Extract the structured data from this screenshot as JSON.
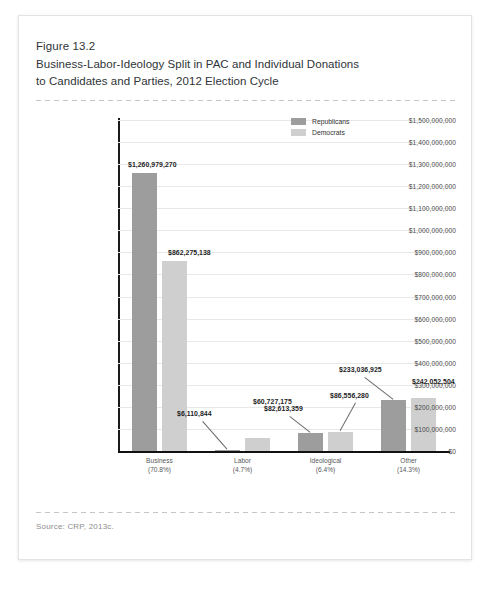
{
  "figure": {
    "number": "Figure 13.2",
    "title_line1": "Business-Labor-Ideology Split in PAC and Individual Donations",
    "title_line2": "to Candidates and Parties, 2012 Election Cycle",
    "source": "Source: CRP, 2013c."
  },
  "colors": {
    "republican": "#9d9d9d",
    "democrat": "#cfcfcf",
    "axis": "#111111",
    "gridline": "#e8e8e8",
    "page_border": "#e3e3e3"
  },
  "chart_data": {
    "type": "bar",
    "title": "Business-Labor-Ideology Split in PAC and Individual Donations to Candidates and Parties, 2012 Election Cycle",
    "xlabel": "",
    "ylabel": "",
    "grid": true,
    "legend_position": "top-right",
    "ylim": [
      0,
      1500000000
    ],
    "ytick_values": [
      0,
      100000000,
      200000000,
      300000000,
      400000000,
      500000000,
      600000000,
      700000000,
      800000000,
      900000000,
      1000000000,
      1100000000,
      1200000000,
      1300000000,
      1400000000,
      1500000000
    ],
    "ytick_labels": [
      "$0",
      "$100,000,000",
      "$200,000,000",
      "$300,000,000",
      "$400,000,000",
      "$500,000,000",
      "$600,000,000",
      "$700,000,000",
      "$800,000,000",
      "$900,000,000",
      "$1,000,000,000",
      "$1,100,000,000",
      "$1,200,000,000",
      "$1,300,000,000",
      "$1,400,000,000",
      "$1,500,000,000"
    ],
    "categories": [
      "Business",
      "Labor",
      "Ideological",
      "Other"
    ],
    "category_percents": [
      "(70.8%)",
      "(4.7%)",
      "(6.4%)",
      "(14.3%)"
    ],
    "series": [
      {
        "name": "Republicans",
        "values": [
          1260979270,
          6110844,
          82613359,
          233036925
        ],
        "labels": [
          "$1,260,979,270",
          "$6,110,844",
          "$82,613,359",
          "$233,036,925"
        ]
      },
      {
        "name": "Democrats",
        "values": [
          862275138,
          60727175,
          86556280,
          242052504
        ],
        "labels": [
          "$862,275,138",
          "$60,727,175",
          "$86,556,280",
          "$242,052,504"
        ]
      }
    ]
  }
}
